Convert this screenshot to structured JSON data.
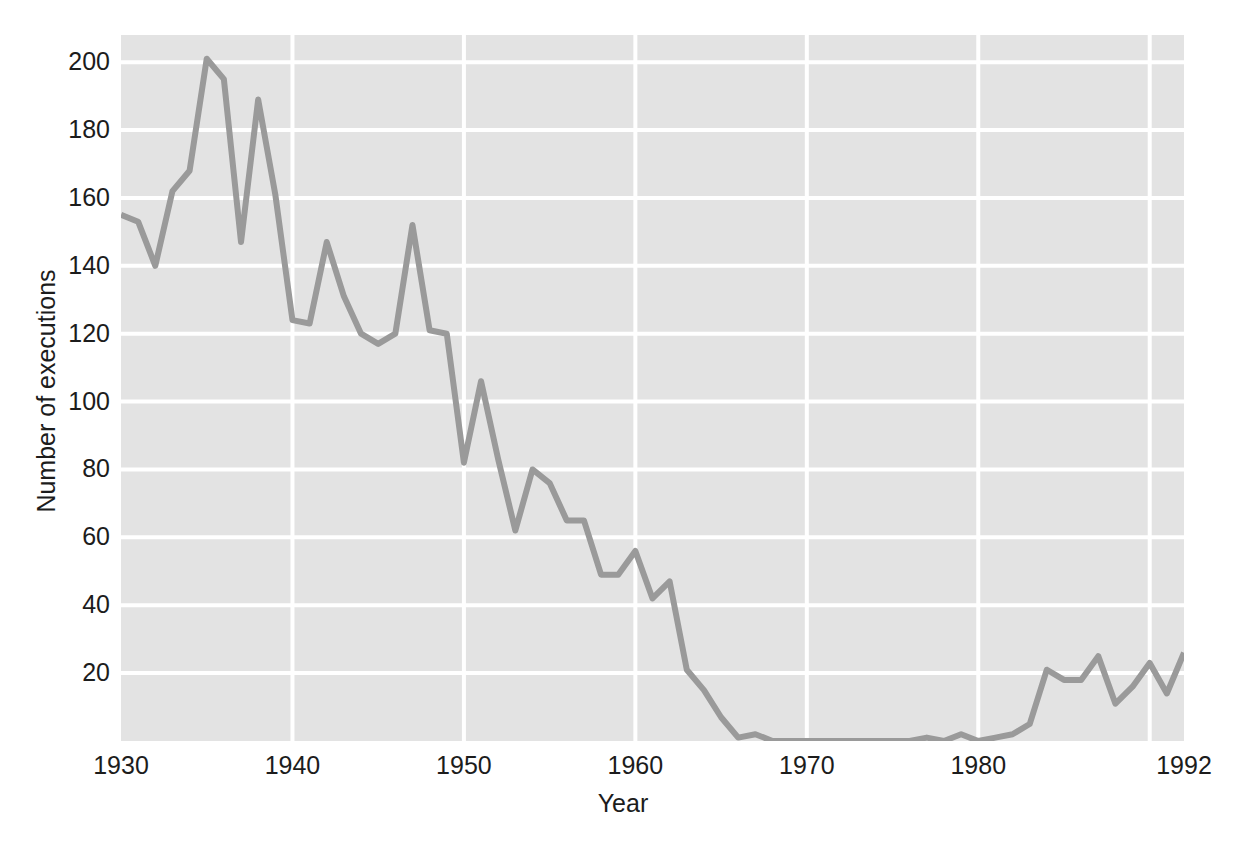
{
  "chart_data": {
    "type": "line",
    "title": "",
    "xlabel": "Year",
    "ylabel": "Number of executions",
    "xlim": [
      1930,
      1992
    ],
    "ylim": [
      0,
      208
    ],
    "xticks": [
      1930,
      1940,
      1950,
      1960,
      1970,
      1980,
      1992
    ],
    "xticklabels": [
      "1930",
      "1940",
      "1950",
      "1960",
      "1970",
      "1980",
      "1992"
    ],
    "yticks": [
      20,
      40,
      60,
      80,
      100,
      120,
      140,
      160,
      180,
      200
    ],
    "yticklabels": [
      "20",
      "40",
      "60",
      "80",
      "100",
      "120",
      "140",
      "160",
      "180",
      "200"
    ],
    "grid": true,
    "grid_color": "#ffffff",
    "plot_background": "#e3e3e3",
    "figure_background": "#ffffff",
    "line_color": "#9a9a9a",
    "line_width": 6,
    "legend": null,
    "x": [
      1930,
      1931,
      1932,
      1933,
      1934,
      1935,
      1936,
      1937,
      1938,
      1939,
      1940,
      1941,
      1942,
      1943,
      1944,
      1945,
      1946,
      1947,
      1948,
      1949,
      1950,
      1951,
      1952,
      1953,
      1954,
      1955,
      1956,
      1957,
      1958,
      1959,
      1960,
      1961,
      1962,
      1963,
      1964,
      1965,
      1966,
      1967,
      1968,
      1969,
      1970,
      1971,
      1972,
      1973,
      1974,
      1975,
      1976,
      1977,
      1978,
      1979,
      1980,
      1981,
      1982,
      1983,
      1984,
      1985,
      1986,
      1987,
      1988,
      1989,
      1990,
      1991,
      1992
    ],
    "values": [
      155,
      153,
      140,
      162,
      168,
      201,
      195,
      147,
      189,
      161,
      124,
      123,
      147,
      131,
      120,
      117,
      120,
      152,
      121,
      120,
      82,
      106,
      83,
      62,
      80,
      76,
      65,
      65,
      49,
      49,
      56,
      42,
      47,
      21,
      15,
      7,
      1,
      2,
      0,
      0,
      0,
      0,
      0,
      0,
      0,
      0,
      0,
      1,
      0,
      2,
      0,
      1,
      2,
      5,
      21,
      18,
      18,
      25,
      11,
      16,
      23,
      14,
      26
    ],
    "series": [
      {
        "name": "Number of executions",
        "color": "#9a9a9a",
        "values": [
          155,
          153,
          140,
          162,
          168,
          201,
          195,
          147,
          189,
          161,
          124,
          123,
          147,
          131,
          120,
          117,
          120,
          152,
          121,
          120,
          82,
          106,
          83,
          62,
          80,
          76,
          65,
          65,
          49,
          49,
          56,
          42,
          47,
          21,
          15,
          7,
          1,
          2,
          0,
          0,
          0,
          0,
          0,
          0,
          0,
          0,
          0,
          1,
          0,
          2,
          0,
          1,
          2,
          5,
          21,
          18,
          18,
          25,
          11,
          16,
          23,
          14,
          26
        ]
      }
    ]
  }
}
